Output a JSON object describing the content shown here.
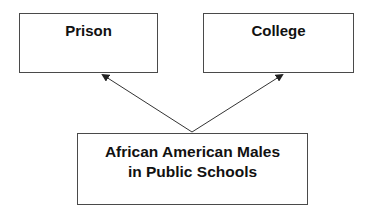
{
  "diagram": {
    "nodes": [
      {
        "id": "prison",
        "label": "Prison"
      },
      {
        "id": "college",
        "label": "College"
      },
      {
        "id": "source",
        "label_line1": "African American Males",
        "label_line2": "in Public Schools"
      }
    ],
    "edges": [
      {
        "from": "source",
        "to": "prison"
      },
      {
        "from": "source",
        "to": "college"
      }
    ],
    "colors": {
      "border": "#4a4a4a",
      "text": "#111111",
      "arrow": "#333333"
    }
  }
}
